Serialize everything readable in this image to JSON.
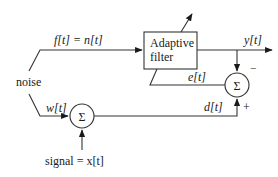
{
  "diagram": {
    "blocks": {
      "adaptive_filter": {
        "line1": "Adaptive",
        "line2": "filter"
      },
      "sum_top": {
        "symbol": "Σ",
        "minus_sign": "−",
        "plus_sign": "+"
      },
      "sum_bottom": {
        "symbol": "Σ"
      }
    },
    "labels": {
      "noise": "noise",
      "f_eq_n": "f[t] = n[t]",
      "w": "w[t]",
      "signal": "signal = x[t]",
      "y": "y[t]",
      "e": "e[t]",
      "d": "d[t]"
    },
    "colors": {
      "line": "#333333",
      "text": "#1a1a1a",
      "background": "#ffffff"
    }
  }
}
